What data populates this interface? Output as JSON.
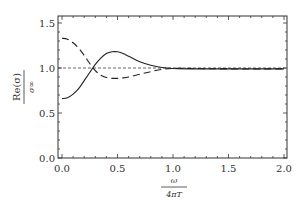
{
  "chart_data": {
    "type": "line",
    "title": "",
    "xlabel": "ω / 4πT",
    "ylabel": "Re(σ) / σ∞",
    "xlim": [
      0.0,
      2.0
    ],
    "ylim": [
      0.0,
      1.58
    ],
    "grid": false,
    "legend": null,
    "x_ticks": [
      "0.0",
      "0.5",
      "1.0",
      "1.5",
      "2.0"
    ],
    "y_ticks": [
      "0.0",
      "0.5",
      "1.0",
      "1.5"
    ],
    "reference_line": {
      "y": 1.0,
      "style": "dashed-fine"
    },
    "x": [
      0.0,
      0.05,
      0.1,
      0.15,
      0.2,
      0.25,
      0.3,
      0.35,
      0.4,
      0.45,
      0.5,
      0.55,
      0.6,
      0.7,
      0.8,
      0.9,
      1.0,
      1.2,
      1.5,
      2.0
    ],
    "series": [
      {
        "name": "solid",
        "style": "solid",
        "values": [
          0.66,
          0.67,
          0.71,
          0.77,
          0.86,
          0.95,
          1.04,
          1.11,
          1.16,
          1.18,
          1.18,
          1.16,
          1.13,
          1.07,
          1.03,
          1.005,
          0.995,
          0.99,
          0.99,
          0.99
        ]
      },
      {
        "name": "dashed",
        "style": "dashed",
        "values": [
          1.33,
          1.32,
          1.28,
          1.22,
          1.14,
          1.05,
          0.97,
          0.92,
          0.895,
          0.885,
          0.885,
          0.89,
          0.9,
          0.93,
          0.96,
          0.985,
          0.995,
          0.995,
          0.99,
          0.99
        ]
      }
    ]
  },
  "labels": {
    "y_numerator": "Re(σ)",
    "y_denominator": "σ∞",
    "x_numerator": "ω",
    "x_denominator": "4πT"
  },
  "colors": {
    "line": "#222222",
    "frame": "#333333"
  }
}
